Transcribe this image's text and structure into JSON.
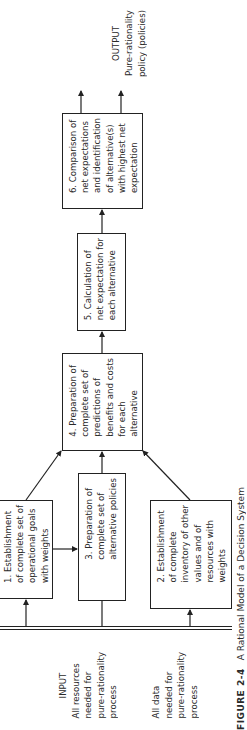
{
  "diagram": {
    "orientation": "rotated-90-ccw",
    "input": {
      "label": "INPUT",
      "resources": "All resources\nneeded for\npure-rationality\nprocess",
      "data": "All data\nneeded for\npure-rationality\nprocess"
    },
    "output": {
      "label": "OUTPUT",
      "text": "Pure-rationality\npolicy (policies)"
    },
    "boxes": [
      {
        "id": 1,
        "text": "1. Establishment\nof complete set of\noperational goals\nwith weights"
      },
      {
        "id": 2,
        "text": "2. Establishment\nof complete\ninventory of other\nvalues and of\nresources with\nweights"
      },
      {
        "id": 3,
        "text": "3. Preparation of\ncomplete set of\nalternative policies"
      },
      {
        "id": 4,
        "text": "4. Preparation of\ncomplete set of\npredictions of\nbenefits and costs\nfor each\nalternative"
      },
      {
        "id": 5,
        "text": "5. Calculation of\nnet expectation for\neach alternative"
      },
      {
        "id": 6,
        "text": "6. Comparison of\nnet expectations\nand identification\nof alternative(s)\nwith highest net\nexpectation"
      }
    ],
    "edges": [
      {
        "from": "input",
        "to": 1
      },
      {
        "from": "input",
        "to": 2
      },
      {
        "from": "input",
        "to": 3
      },
      {
        "from": 1,
        "to": 3
      },
      {
        "from": 1,
        "to": 4
      },
      {
        "from": 3,
        "to": 4
      },
      {
        "from": 2,
        "to": 4
      },
      {
        "from": 4,
        "to": 5
      },
      {
        "from": 5,
        "to": 6
      },
      {
        "from": 6,
        "to": "output"
      }
    ]
  },
  "caption": {
    "figure_label": "FIGURE 2-4",
    "title": "A Rational Model of a Decision System"
  }
}
